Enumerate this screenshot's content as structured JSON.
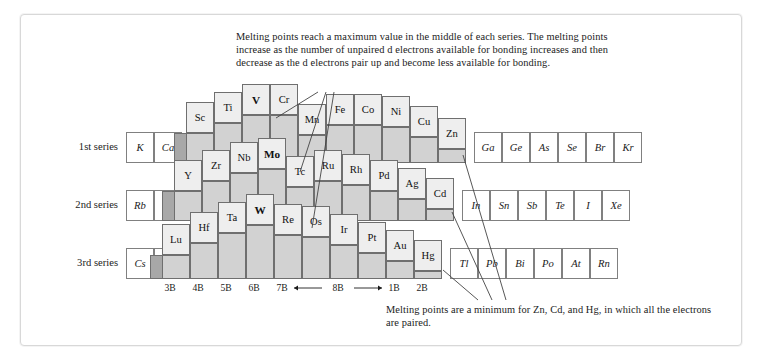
{
  "figure": {
    "caption_top": "Melting points reach a maximum value in the middle of each series. The melting points increase as the number of unpaired d electrons available for bonding increases and then decrease as the d electrons pair up and become less available for bonding.",
    "caption_bottom": "Melting points are a minimum for Zn, Cd, and Hg, in which all the electrons are paired.",
    "series_labels": [
      "1st series",
      "2nd series",
      "3rd series"
    ],
    "group_labels": [
      "3B",
      "4B",
      "5B",
      "6B",
      "7B",
      "8B",
      "1B",
      "2B"
    ],
    "group_8b_arrows": "←        →"
  },
  "chart_data": {
    "type": "bar",
    "xlabel": "Group",
    "ylabel": "Melting point (relative block height)",
    "categories": [
      "3B",
      "4B",
      "5B",
      "6B",
      "7B",
      "8B",
      "8B",
      "8B",
      "1B",
      "2B"
    ],
    "series": [
      {
        "name": "1st series",
        "elements": [
          "Sc",
          "Ti",
          "V",
          "Cr",
          "Mn",
          "Fe",
          "Co",
          "Ni",
          "Cu",
          "Zn"
        ],
        "values": [
          30,
          40,
          48,
          48,
          28,
          38,
          38,
          36,
          26,
          14
        ],
        "maximum": "V",
        "minimum": "Zn"
      },
      {
        "name": "2nd series",
        "elements": [
          "Y",
          "Zr",
          "Nb",
          "Mo",
          "Tc",
          "Ru",
          "Rh",
          "Pd",
          "Ag",
          "Cd"
        ],
        "values": [
          30,
          40,
          48,
          52,
          34,
          40,
          36,
          30,
          22,
          12
        ],
        "maximum": "Mo",
        "minimum": "Cd"
      },
      {
        "name": "3rd series",
        "elements": [
          "Lu",
          "Hf",
          "Ta",
          "W",
          "Re",
          "Os",
          "Ir",
          "Pt",
          "Au",
          "Hg"
        ],
        "values": [
          24,
          36,
          46,
          54,
          44,
          42,
          34,
          26,
          18,
          8
        ],
        "maximum": "W",
        "minimum": "Hg"
      }
    ],
    "bold_elements": [
      "V",
      "Mo",
      "W"
    ],
    "main_group_rows": [
      {
        "series": "1st series",
        "left": [
          "K",
          "Ca"
        ],
        "right": [
          "Ga",
          "Ge",
          "As",
          "Se",
          "Br",
          "Kr"
        ]
      },
      {
        "series": "2nd series",
        "left": [
          "Rb",
          "Sr"
        ],
        "right": [
          "In",
          "Sn",
          "Sb",
          "Te",
          "I",
          "Xe"
        ]
      },
      {
        "series": "3rd series",
        "left": [
          "Cs",
          "Ba"
        ],
        "right": [
          "Tl",
          "Pb",
          "Bi",
          "Po",
          "At",
          "Rn"
        ]
      }
    ],
    "legend": [],
    "grid": false
  },
  "colors": {
    "block_top": "#eeeeee",
    "block_side": "#b9b9b9",
    "block_front": "#d2d2d2",
    "shade": "#a8a8a8",
    "outline": "#6f6f6f",
    "text": "#1b1b1b",
    "frame": "#d8d8d8"
  }
}
